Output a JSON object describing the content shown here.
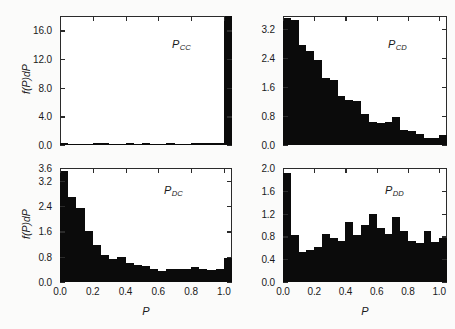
{
  "figure": {
    "background_color": "#fbfbfa",
    "ink_color": "#0b0b0b",
    "axis_color": "#2b2b2b",
    "x_axis_title": "P",
    "y_axis_title": "f(P)dP"
  },
  "panels": {
    "cc": {
      "label_main": "P",
      "label_sub": "CC",
      "y_ticks": [
        "0.0",
        "4.0",
        "8.0",
        "12.0",
        "16.0"
      ],
      "x_ticks": [
        "0.0",
        "0.2",
        "0.4",
        "0.6",
        "0.8",
        "1.0"
      ]
    },
    "cd": {
      "label_main": "P",
      "label_sub": "CD",
      "y_ticks": [
        "0.0",
        "0.8",
        "1.6",
        "2.4",
        "3.2"
      ],
      "x_ticks": [
        "0.0",
        "0.2",
        "0.4",
        "0.6",
        "0.8",
        "1.0"
      ]
    },
    "dc": {
      "label_main": "P",
      "label_sub": "DC",
      "y_ticks": [
        "0.0",
        "0.8",
        "1.6",
        "2.4",
        "3.2",
        "3.6"
      ],
      "x_ticks": [
        "0.0",
        "0.2",
        "0.4",
        "0.6",
        "0.8",
        "1.0"
      ]
    },
    "dd": {
      "label_main": "P",
      "label_sub": "DD",
      "y_ticks": [
        "0.0",
        "0.4",
        "0.8",
        "1.2",
        "1.6",
        "2.0"
      ],
      "x_ticks": [
        "0.0",
        "0.2",
        "0.4",
        "0.6",
        "0.8",
        "1.0"
      ]
    }
  },
  "chart_data": [
    {
      "type": "bar",
      "id": "P_CC",
      "title": "P_CC",
      "xlabel": "P",
      "ylabel": "f(P)dP",
      "xlim": [
        0.0,
        1.05
      ],
      "ylim": [
        0.0,
        18.0
      ],
      "yticks": [
        0.0,
        4.0,
        8.0,
        12.0,
        16.0
      ],
      "xticks": [
        0.0,
        0.2,
        0.4,
        0.6,
        0.8,
        1.0
      ],
      "grid": false,
      "legend": "none",
      "bin_width": 0.05,
      "x": [
        0.025,
        0.075,
        0.125,
        0.175,
        0.225,
        0.275,
        0.325,
        0.375,
        0.425,
        0.475,
        0.525,
        0.575,
        0.625,
        0.675,
        0.725,
        0.775,
        0.825,
        0.875,
        0.925,
        0.975,
        1.025
      ],
      "values": [
        0.25,
        0.2,
        0.2,
        0.2,
        0.3,
        0.3,
        0.2,
        0.2,
        0.25,
        0.2,
        0.25,
        0.2,
        0.2,
        0.25,
        0.2,
        0.2,
        0.25,
        0.3,
        0.25,
        0.3,
        18.0
      ]
    },
    {
      "type": "bar",
      "id": "P_CD",
      "title": "P_CD",
      "xlabel": "P",
      "ylabel": "f(P)dP",
      "xlim": [
        0.0,
        1.05
      ],
      "ylim": [
        0.0,
        3.55
      ],
      "yticks": [
        0.0,
        0.8,
        1.6,
        2.4,
        3.2
      ],
      "xticks": [
        0.0,
        0.2,
        0.4,
        0.6,
        0.8,
        1.0
      ],
      "grid": false,
      "legend": "none",
      "bin_width": 0.05,
      "x": [
        0.025,
        0.075,
        0.125,
        0.175,
        0.225,
        0.275,
        0.325,
        0.375,
        0.425,
        0.475,
        0.525,
        0.575,
        0.625,
        0.675,
        0.725,
        0.775,
        0.825,
        0.875,
        0.925,
        0.975,
        1.025
      ],
      "values": [
        3.5,
        3.45,
        2.75,
        2.6,
        2.35,
        1.85,
        1.8,
        1.35,
        1.25,
        1.2,
        0.85,
        0.62,
        0.6,
        0.62,
        0.78,
        0.42,
        0.38,
        0.3,
        0.2,
        0.18,
        0.28
      ]
    },
    {
      "type": "bar",
      "id": "P_DC",
      "title": "P_DC",
      "xlabel": "P",
      "ylabel": "f(P)dP",
      "xlim": [
        0.0,
        1.05
      ],
      "ylim": [
        0.0,
        3.6
      ],
      "yticks": [
        0.0,
        0.8,
        1.6,
        2.4,
        3.2,
        3.6
      ],
      "xticks": [
        0.0,
        0.2,
        0.4,
        0.6,
        0.8,
        1.0
      ],
      "grid": false,
      "legend": "none",
      "bin_width": 0.05,
      "x": [
        0.025,
        0.075,
        0.125,
        0.175,
        0.225,
        0.275,
        0.325,
        0.375,
        0.425,
        0.475,
        0.525,
        0.575,
        0.625,
        0.675,
        0.725,
        0.775,
        0.825,
        0.875,
        0.925,
        0.975,
        1.025
      ],
      "values": [
        3.5,
        2.7,
        2.35,
        1.6,
        1.18,
        0.85,
        0.72,
        0.78,
        0.6,
        0.55,
        0.5,
        0.42,
        0.36,
        0.4,
        0.42,
        0.4,
        0.46,
        0.42,
        0.38,
        0.4,
        0.75
      ]
    },
    {
      "type": "bar",
      "id": "P_DD",
      "title": "P_DD",
      "xlabel": "P",
      "ylabel": "f(P)dP",
      "xlim": [
        0.0,
        1.05
      ],
      "ylim": [
        0.0,
        2.0
      ],
      "yticks": [
        0.0,
        0.4,
        0.8,
        1.2,
        1.6,
        2.0
      ],
      "xticks": [
        0.0,
        0.2,
        0.4,
        0.6,
        0.8,
        1.0
      ],
      "grid": false,
      "legend": "none",
      "bin_width": 0.05,
      "x": [
        0.025,
        0.075,
        0.125,
        0.175,
        0.225,
        0.275,
        0.325,
        0.375,
        0.425,
        0.475,
        0.525,
        0.575,
        0.625,
        0.675,
        0.725,
        0.775,
        0.825,
        0.875,
        0.925,
        0.975,
        1.025
      ],
      "values": [
        1.92,
        0.82,
        0.52,
        0.56,
        0.62,
        0.84,
        0.78,
        0.72,
        1.06,
        0.82,
        1.0,
        1.2,
        0.95,
        0.85,
        1.14,
        0.9,
        0.72,
        0.68,
        0.9,
        0.7,
        0.78
      ]
    }
  ]
}
